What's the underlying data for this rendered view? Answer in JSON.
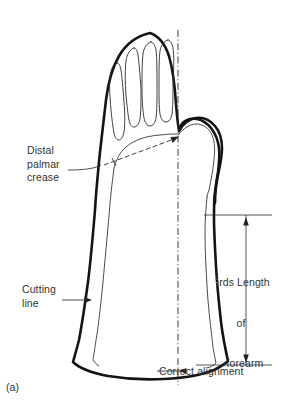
{
  "figure": {
    "caption": "(a)"
  },
  "labels": {
    "distal_palmar_crease": "Distal\npalmar\ncrease",
    "cutting_line": "Cutting\nline",
    "correct_alignment": "Correct alignment",
    "forearm_length": {
      "fraction_numerator": "2",
      "fraction_denominator": "3",
      "line1": "rds Length",
      "line2": "of",
      "line3": "forearm",
      "full_text": "⅔rds Length of forearm"
    }
  },
  "colors": {
    "background": "#ffffff",
    "outline_bold": "#141414",
    "outline_thin": "#2a2a2a",
    "annotation": "#2b2b2b",
    "text": "#333333"
  },
  "geometry": {
    "centerline_x": 178,
    "centerline_top_y": 30,
    "centerline_bottom_y": 385,
    "dimension_line_x": 246,
    "dimension_top_y": 215,
    "dimension_bottom_y": 365,
    "crease_arrow_tip": [
      178,
      137
    ],
    "cutting_arrow_tip": [
      92,
      300
    ]
  }
}
